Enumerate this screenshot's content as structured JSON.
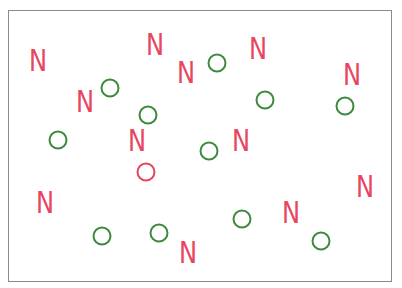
{
  "colors": {
    "red": "#e8455f",
    "green": "#3d8a3f",
    "frame": "#8a8a8a"
  },
  "stimulus": {
    "letter_glyph": "N",
    "ring_diameter": 19,
    "ring_stroke": 2,
    "items": [
      {
        "type": "letter",
        "color": "red",
        "x": 38,
        "y": 60
      },
      {
        "type": "letter",
        "color": "red",
        "x": 155,
        "y": 44
      },
      {
        "type": "letter",
        "color": "red",
        "x": 186,
        "y": 72
      },
      {
        "type": "ring",
        "color": "green",
        "x": 217,
        "y": 63
      },
      {
        "type": "letter",
        "color": "red",
        "x": 258,
        "y": 48
      },
      {
        "type": "letter",
        "color": "red",
        "x": 352,
        "y": 74
      },
      {
        "type": "letter",
        "color": "red",
        "x": 85,
        "y": 101
      },
      {
        "type": "ring",
        "color": "green",
        "x": 110,
        "y": 88
      },
      {
        "type": "ring",
        "color": "green",
        "x": 148,
        "y": 115
      },
      {
        "type": "ring",
        "color": "green",
        "x": 265,
        "y": 100
      },
      {
        "type": "ring",
        "color": "green",
        "x": 345,
        "y": 106
      },
      {
        "type": "ring",
        "color": "green",
        "x": 58,
        "y": 140
      },
      {
        "type": "letter",
        "color": "red",
        "x": 137,
        "y": 140
      },
      {
        "type": "ring",
        "color": "red",
        "x": 146,
        "y": 172
      },
      {
        "type": "ring",
        "color": "green",
        "x": 209,
        "y": 151
      },
      {
        "type": "letter",
        "color": "red",
        "x": 241,
        "y": 140
      },
      {
        "type": "letter",
        "color": "red",
        "x": 45,
        "y": 202
      },
      {
        "type": "letter",
        "color": "red",
        "x": 365,
        "y": 186
      },
      {
        "type": "ring",
        "color": "green",
        "x": 242,
        "y": 219
      },
      {
        "type": "letter",
        "color": "red",
        "x": 291,
        "y": 212
      },
      {
        "type": "ring",
        "color": "green",
        "x": 102,
        "y": 236
      },
      {
        "type": "ring",
        "color": "green",
        "x": 159,
        "y": 233
      },
      {
        "type": "letter",
        "color": "red",
        "x": 188,
        "y": 252
      },
      {
        "type": "ring",
        "color": "green",
        "x": 321,
        "y": 241
      }
    ]
  }
}
